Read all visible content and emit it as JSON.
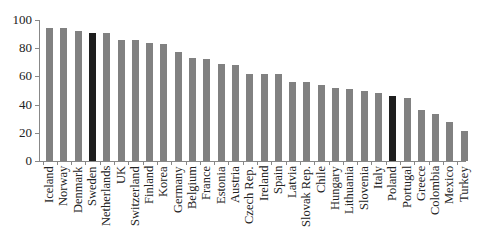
{
  "chart_data": {
    "type": "bar",
    "title": "",
    "xlabel": "",
    "ylabel": "",
    "ylim": [
      0,
      100
    ],
    "yticks": [
      0,
      20,
      40,
      60,
      80,
      100
    ],
    "grid": false,
    "legend": null,
    "categories": [
      "Iceland",
      "Norway",
      "Denmark",
      "Sweden",
      "Netherlands",
      "UK",
      "Switzerland",
      "Finland",
      "Korea",
      "Germany",
      "Belgium",
      "France",
      "Estonia",
      "Austria",
      "Czech Rep.",
      "Ireland",
      "Spain",
      "Latvia",
      "Slovak Rep.",
      "Chile",
      "Hungary",
      "Lithuania",
      "Slovenia",
      "Italy",
      "Poland",
      "Portugal",
      "Greece",
      "Colombia",
      "Mexico",
      "Turkey"
    ],
    "values": [
      94,
      94,
      92,
      91,
      91,
      86,
      86,
      84,
      83,
      77,
      73,
      72,
      69,
      68,
      62,
      62,
      62,
      56,
      56,
      54,
      52,
      51,
      50,
      48,
      46,
      45,
      36,
      33,
      28,
      21
    ],
    "highlighted": [
      "Sweden",
      "Poland"
    ],
    "colors": {
      "default": "#818181",
      "highlight": "#1e1e1e"
    }
  }
}
